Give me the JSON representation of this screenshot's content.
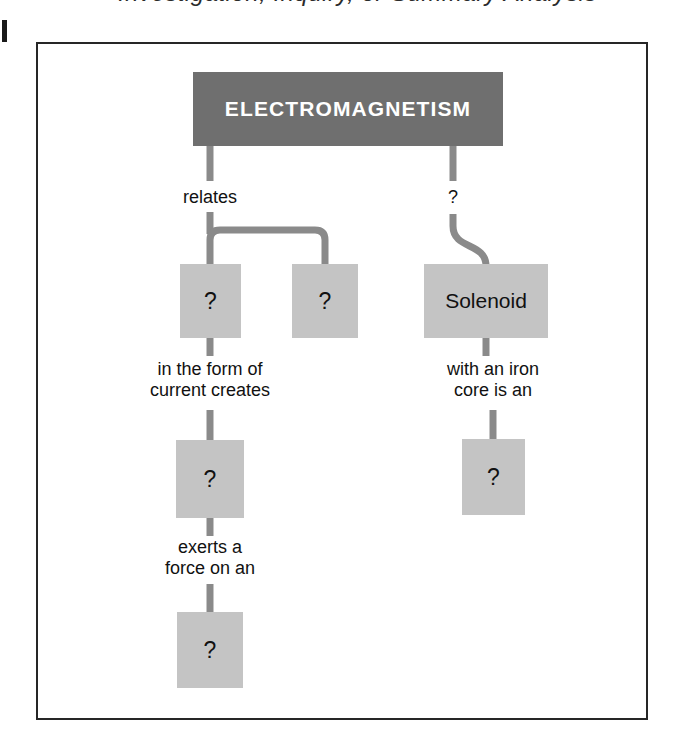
{
  "page": {
    "header_fragment": "Investigation, Inquiry, or Summary Analysis",
    "edge_mark": "margin-tick"
  },
  "diagram": {
    "type": "concept-map",
    "title_node": {
      "label": "ELECTROMAGNETISM",
      "fill": "#6f6f6f",
      "text_color": "#ffffff"
    },
    "node_fill": "#c4c4c4",
    "connector_color": "#8a8a8a",
    "frame_color": "#262626",
    "nodes": [
      {
        "id": "n1",
        "label": "?",
        "x": 142,
        "y": 220,
        "w": 61,
        "h": 74
      },
      {
        "id": "n2",
        "label": "?",
        "x": 254,
        "y": 220,
        "w": 66,
        "h": 74
      },
      {
        "id": "n3",
        "label": "Solenoid",
        "x": 386,
        "y": 220,
        "w": 124,
        "h": 74
      },
      {
        "id": "n4",
        "label": "?",
        "x": 138,
        "y": 396,
        "w": 68,
        "h": 78
      },
      {
        "id": "n5",
        "label": "?",
        "x": 424,
        "y": 395,
        "w": 63,
        "h": 76
      },
      {
        "id": "n6",
        "label": "?",
        "x": 139,
        "y": 568,
        "w": 66,
        "h": 76
      }
    ],
    "edge_labels": [
      {
        "id": "e1",
        "text": "relates",
        "x": 122,
        "y": 150,
        "w": 100
      },
      {
        "id": "e2",
        "text": "?",
        "x": 362,
        "y": 150,
        "w": 40
      },
      {
        "id": "e3",
        "text": "in the form of\ncurrent creates",
        "x": 96,
        "y": 310,
        "w": 150
      },
      {
        "id": "e4",
        "text": "with an iron\ncore is an",
        "x": 378,
        "y": 310,
        "w": 140
      },
      {
        "id": "e5",
        "text": "exerts a\nforce on an",
        "x": 112,
        "y": 485,
        "w": 120
      }
    ]
  }
}
